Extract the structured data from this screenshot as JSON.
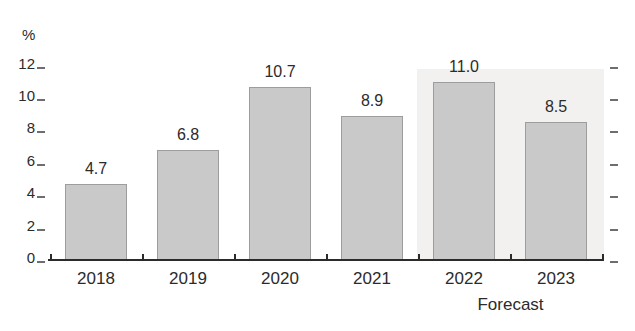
{
  "chart_data": {
    "type": "bar",
    "unit_label": "%",
    "categories": [
      "2018",
      "2019",
      "2020",
      "2021",
      "2022",
      "2023"
    ],
    "values": [
      4.7,
      6.8,
      10.7,
      8.9,
      11.0,
      8.5
    ],
    "data_labels": [
      "4.7",
      "6.8",
      "10.7",
      "8.9",
      "11.0",
      "8.5"
    ],
    "yticks": [
      0,
      2,
      4,
      6,
      8,
      10,
      12
    ],
    "ytick_labels": [
      "0",
      "2",
      "4",
      "6",
      "8",
      "10",
      "12"
    ],
    "ylim": [
      0,
      12
    ],
    "grid": "off",
    "legend": "none",
    "annotation": "Forecast",
    "forecast_categories": [
      "2022",
      "2023"
    ],
    "axis_style": "baseline with boundary ticks, dash tick marks on left (labeled) and right (unlabeled)",
    "colors": {
      "bar_fill": "#c9c9c9",
      "bar_border": "#9d9d9d",
      "forecast_bg": "#f2f1ef",
      "axis": "#2b2b2b",
      "text": "#2b2b2b",
      "tick_dash": "#6e6e6e",
      "page_bg": "#ffffff"
    }
  }
}
